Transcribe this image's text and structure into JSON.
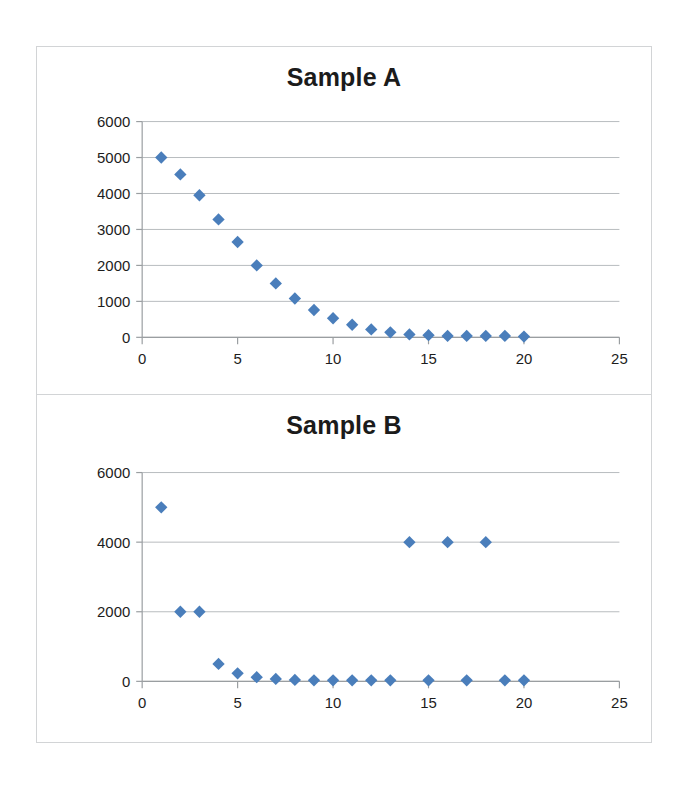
{
  "figure": {
    "background_color": "#ffffff",
    "panel_border_color": "#d2d4d6",
    "marker_color": "#4a7ebb",
    "gridline_color": "#b7bbbe",
    "axis_color": "#9a9ea1"
  },
  "chart_data": [
    {
      "type": "scatter",
      "title": "Sample A",
      "xlabel": "",
      "ylabel": "",
      "xlim": [
        0,
        25
      ],
      "ylim": [
        0,
        6000
      ],
      "xticks": [
        0,
        5,
        10,
        15,
        20,
        25
      ],
      "xtick_labels": [
        "0",
        "5",
        "10",
        "15",
        "20",
        "25"
      ],
      "yticks": [
        0,
        1000,
        2000,
        3000,
        4000,
        5000,
        6000
      ],
      "ytick_labels": [
        "0",
        "1000",
        "2000",
        "3000",
        "4000",
        "5000",
        "6000"
      ],
      "grid": true,
      "grid_axis": "y",
      "legend": false,
      "marker": "diamond",
      "marker_color": "#4a7ebb",
      "x": [
        1,
        2,
        3,
        4,
        5,
        6,
        7,
        8,
        9,
        10,
        11,
        12,
        13,
        14,
        15,
        16,
        17,
        18,
        19,
        20
      ],
      "y": [
        5000,
        4530,
        3950,
        3280,
        2650,
        2000,
        1500,
        1080,
        760,
        530,
        350,
        220,
        140,
        80,
        60,
        40,
        40,
        40,
        40,
        20
      ]
    },
    {
      "type": "scatter",
      "title": "Sample B",
      "xlabel": "",
      "ylabel": "",
      "xlim": [
        0,
        25
      ],
      "ylim": [
        0,
        6000
      ],
      "xticks": [
        0,
        5,
        10,
        15,
        20,
        25
      ],
      "xtick_labels": [
        "0",
        "5",
        "10",
        "15",
        "20",
        "25"
      ],
      "yticks": [
        0,
        2000,
        4000,
        6000
      ],
      "ytick_labels": [
        "0",
        "2000",
        "4000",
        "6000"
      ],
      "grid": true,
      "grid_axis": "y",
      "legend": false,
      "marker": "diamond",
      "marker_color": "#4a7ebb",
      "x": [
        1,
        2,
        3,
        4,
        5,
        6,
        7,
        8,
        9,
        10,
        11,
        12,
        13,
        14,
        15,
        16,
        17,
        18,
        19,
        20
      ],
      "y": [
        5000,
        2000,
        2000,
        500,
        230,
        120,
        70,
        40,
        30,
        30,
        30,
        30,
        30,
        4000,
        30,
        4000,
        30,
        4000,
        30,
        30
      ]
    }
  ]
}
